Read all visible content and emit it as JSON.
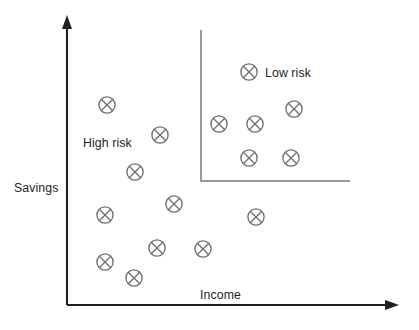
{
  "chart_data": {
    "type": "scatter",
    "title": "",
    "xlabel": "Income",
    "ylabel": "Savings",
    "xlim": [
      0,
      100
    ],
    "ylim": [
      0,
      100
    ],
    "grid": false,
    "legend": "none",
    "annotations": [
      {
        "text": "High risk",
        "x": 21,
        "y": 60
      },
      {
        "text": "Low risk",
        "x": 60,
        "y": 84
      }
    ],
    "decision_boundary": {
      "description": "L-shaped threshold separating the low-risk region (high income and high savings) from the high-risk region",
      "vertical_x": 201,
      "vertical_y_top": 30,
      "vertical_y_bottom": 181,
      "horizontal_x_end": 350,
      "color": "#7a7a7a"
    },
    "series": [
      {
        "name": "High risk",
        "marker": "circle-with-cross",
        "color": "#6e6e6e",
        "points": [
          {
            "px": 107,
            "py": 105
          },
          {
            "px": 160,
            "py": 135
          },
          {
            "px": 135,
            "py": 172
          },
          {
            "px": 174,
            "py": 204
          },
          {
            "px": 105,
            "py": 215
          },
          {
            "px": 256,
            "py": 217
          },
          {
            "px": 157,
            "py": 248
          },
          {
            "px": 203,
            "py": 249
          },
          {
            "px": 105,
            "py": 262
          },
          {
            "px": 134,
            "py": 278
          }
        ]
      },
      {
        "name": "Low risk",
        "marker": "circle-with-cross",
        "color": "#6e6e6e",
        "points": [
          {
            "px": 249,
            "py": 72
          },
          {
            "px": 294,
            "py": 109
          },
          {
            "px": 219,
            "py": 124
          },
          {
            "px": 255,
            "py": 124
          },
          {
            "px": 249,
            "py": 158
          },
          {
            "px": 291,
            "py": 158
          }
        ]
      }
    ]
  },
  "axes": {
    "y_label": "Savings",
    "x_label": "Income",
    "origin_px": {
      "x": 67,
      "y": 305
    },
    "y_axis_top_px": 18,
    "x_axis_right_px": 398,
    "color": "#231f20"
  },
  "labels": {
    "savings": "Savings",
    "income": "Income",
    "high_risk": "High risk",
    "low_risk": "Low risk"
  },
  "colors": {
    "axis": "#231f20",
    "marker_stroke": "#6e6e6e",
    "boundary": "#7a7a7a",
    "background": "#ffffff",
    "text": "#231f20"
  }
}
